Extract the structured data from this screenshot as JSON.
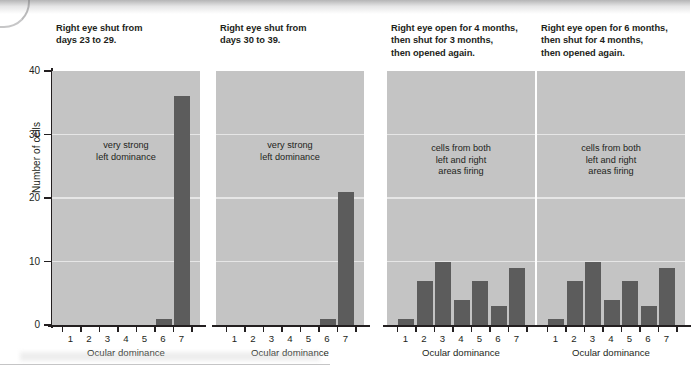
{
  "figure": {
    "y_axis_title": "Number of cells",
    "x_axis_title": "Ocular dominance",
    "y_ticks": [
      "0",
      "10",
      "20",
      "30",
      "40"
    ],
    "x_ticks": [
      "1",
      "2",
      "3",
      "4",
      "5",
      "6",
      "7"
    ],
    "colors": {
      "plot_background": "#c4c4c4",
      "bar": "#5c5c5c",
      "gridline": "#e6e6e6",
      "axis": "#231f20",
      "text": "#231f20"
    }
  },
  "panels": [
    {
      "title": "Right eye shut from\ndays 23 to 29.",
      "note": "very strong\nleft dominance",
      "note_top": 140,
      "values": [
        0,
        0,
        0,
        0,
        0,
        1,
        36
      ]
    },
    {
      "title": "Right eye shut from\ndays 30 to 39.",
      "note": "very strong\nleft dominance",
      "note_top": 140,
      "values": [
        0,
        0,
        0,
        0,
        0,
        1,
        21
      ]
    },
    {
      "title": "Right eye open for 4 months,\nthen shut for 3 months,\nthen opened again.",
      "note": "cells from both\nleft and right\nareas firing",
      "note_top": 143,
      "values": [
        1,
        7,
        10,
        4,
        7,
        3,
        9
      ]
    },
    {
      "title": "Right eye open for 6 months,\nthen shut for 4 months,\nthen opened again.",
      "note": "cells from both\nleft and right\nareas firing",
      "note_top": 143,
      "values": [
        1,
        7,
        10,
        4,
        7,
        3,
        9
      ]
    }
  ],
  "chart_data": {
    "type": "bar",
    "title": "",
    "xlabel": "Ocular dominance",
    "ylabel": "Number of cells",
    "ylim": [
      0,
      42
    ],
    "yticks": [
      0,
      10,
      20,
      30,
      40
    ],
    "categories": [
      "1",
      "2",
      "3",
      "4",
      "5",
      "6",
      "7"
    ],
    "grid": true,
    "legend": "none",
    "panel_layout": "1x4",
    "series": [
      {
        "name": "Right eye shut from days 23 to 29.",
        "annotation": "very strong left dominance",
        "values": [
          0,
          0,
          0,
          0,
          0,
          1,
          36
        ]
      },
      {
        "name": "Right eye shut from days 30 to 39.",
        "annotation": "very strong left dominance",
        "values": [
          0,
          0,
          0,
          0,
          0,
          1,
          21
        ]
      },
      {
        "name": "Right eye open for 4 months, then shut for 3 months, then opened again.",
        "annotation": "cells from both left and right areas firing",
        "values": [
          1,
          7,
          10,
          4,
          7,
          3,
          9
        ]
      },
      {
        "name": "Right eye open for 6 months, then shut for 4 months, then opened again.",
        "annotation": "cells from both left and right areas firing",
        "values": [
          1,
          7,
          10,
          4,
          7,
          3,
          9
        ]
      }
    ]
  }
}
